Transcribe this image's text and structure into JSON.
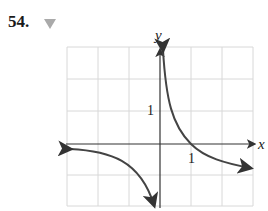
{
  "problem": {
    "number": "54.",
    "toggle_icon": "triangle-down-icon"
  },
  "graph": {
    "x_label": "x",
    "y_label": "y",
    "x_tick_label": "1",
    "y_tick_label": "1",
    "colors": {
      "grid": "#d8d8d8",
      "axis": "#333333",
      "curve": "#444444",
      "toggle": "#aaaaaa"
    }
  }
}
